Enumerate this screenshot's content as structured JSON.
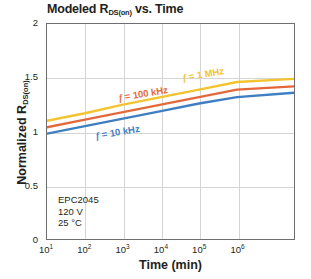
{
  "chart_data": {
    "type": "line",
    "title": "Modeled R",
    "title_sub": "DS(on)",
    "title_tail": " vs. Time",
    "title_full": "Modeled RDS(on) vs. Time",
    "xlabel": "Time (min)",
    "ylabel_main": "Normalized R",
    "ylabel_sub": "DS(on)",
    "ylabel_full": "Normalized RDS(on)",
    "xscale": "log",
    "yscale": "linear",
    "xlim": [
      10,
      31622776
    ],
    "ylim": [
      0,
      2
    ],
    "grid": true,
    "legend_position": "inline-labels",
    "yticks": [
      "0",
      "0.5",
      "1",
      "1.5",
      "2"
    ],
    "ytick_values": [
      0,
      0.5,
      1,
      1.5,
      2
    ],
    "xticks": [
      {
        "mantissa": "10",
        "exponent": "1",
        "value": 10
      },
      {
        "mantissa": "10",
        "exponent": "2",
        "value": 100
      },
      {
        "mantissa": "10",
        "exponent": "3",
        "value": 1000
      },
      {
        "mantissa": "10",
        "exponent": "4",
        "value": 10000
      },
      {
        "mantissa": "10",
        "exponent": "5",
        "value": 100000
      },
      {
        "mantissa": "10",
        "exponent": "6",
        "value": 1000000
      }
    ],
    "x": [
      10,
      100,
      1000,
      10000,
      100000,
      1000000,
      31622776
    ],
    "series": [
      {
        "name": "f = 1 MHz",
        "label_f": "f",
        "label_rest": " = 1 MHz",
        "color": "#f4c430",
        "values": [
          1.1,
          1.17,
          1.25,
          1.32,
          1.39,
          1.46,
          1.49
        ]
      },
      {
        "name": "f = 100 kHz",
        "label_f": "f",
        "label_rest": " = 100 kHz",
        "color": "#e4693a",
        "values": [
          1.04,
          1.11,
          1.18,
          1.25,
          1.32,
          1.39,
          1.42
        ]
      },
      {
        "name": "f = 10 kHz",
        "label_f": "f",
        "label_rest": " = 10 kHz",
        "color": "#3f7fc1",
        "values": [
          0.98,
          1.05,
          1.12,
          1.19,
          1.26,
          1.32,
          1.36
        ]
      }
    ],
    "annotations": [
      {
        "text": "EPC2045"
      },
      {
        "text": "120 V"
      },
      {
        "text": "25 °C"
      }
    ],
    "colors": {
      "axis": "#6e6e6e",
      "grid": "#d4d4d4",
      "text": "#231f20",
      "background": "#ffffff"
    }
  }
}
